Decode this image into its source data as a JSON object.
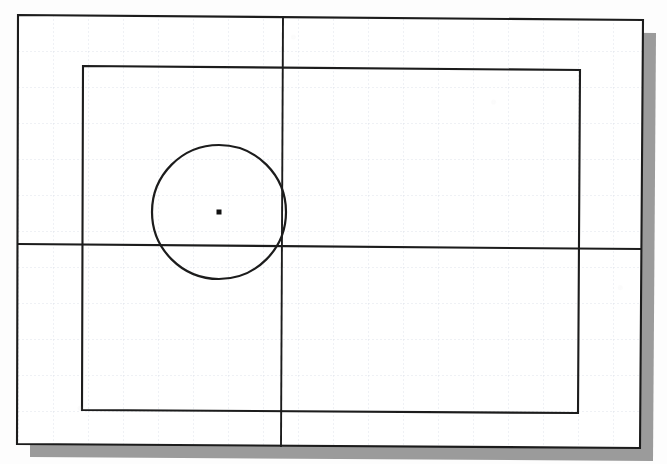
{
  "figure": {
    "background_color": "#ffffff",
    "paper_color": "#fdfdfd"
  },
  "shadow": {
    "name": "drop-shadow",
    "color": "#9b9b9b",
    "offset_x": 13,
    "offset_y": 13
  },
  "grid": {
    "name": "snap-grid",
    "color": "#d8dde6",
    "line_width": 0.8,
    "dash": "2 2",
    "spacing_x": 35,
    "spacing_y": 36,
    "origin_x": 18,
    "origin_y": 15,
    "visible": true
  },
  "outer_border": {
    "name": "drawing-limits-border",
    "color": "#1c1c1c",
    "line_width": 2.1,
    "points": [
      [
        18,
        15
      ],
      [
        643,
        20
      ],
      [
        640,
        448
      ],
      [
        17,
        444
      ]
    ]
  },
  "inner_rectangle": {
    "name": "rectangle-entity",
    "color": "#1c1c1c",
    "line_width": 2.1,
    "points": [
      [
        83,
        66
      ],
      [
        580,
        70
      ],
      [
        578,
        413
      ],
      [
        82,
        410
      ]
    ],
    "width": 497,
    "height": 345
  },
  "axes": {
    "horizontal": {
      "name": "horizontal-construction-line",
      "color": "#1c1c1c",
      "line_width": 2.1,
      "x1": 18,
      "y1": 244,
      "x2": 642,
      "y2": 249
    },
    "vertical": {
      "name": "vertical-construction-line",
      "color": "#1c1c1c",
      "line_width": 1.9,
      "x1": 283,
      "y1": 16,
      "x2": 281,
      "y2": 447
    }
  },
  "circle": {
    "name": "circle-entity",
    "color": "#1c1c1c",
    "line_width": 2.2,
    "center_x": 219,
    "center_y": 212,
    "radius": 67,
    "diameter": 134
  },
  "center_mark": {
    "name": "circle-center-point",
    "color": "#111111",
    "x": 219,
    "y": 212,
    "size": 5
  }
}
